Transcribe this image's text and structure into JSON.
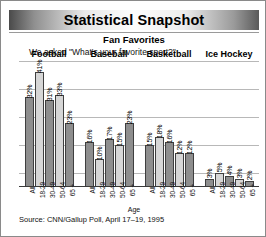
{
  "header": {
    "title": "Statistical Snapshot",
    "subtitle": "Fan Favorites",
    "question": "We asked \"What's your favorite sport?\""
  },
  "footer": {
    "source": "Source: CNN/Gallup Poll, April 17–19, 1995"
  },
  "chart_data": {
    "type": "bar",
    "title": "Fan Favorites",
    "subtitle": "We asked \"What's your favorite sport?\"",
    "xlabel": "Age",
    "ylabel": "",
    "ylim": [
      0,
      45
    ],
    "grid": true,
    "legend": "none",
    "categories": [
      "All",
      "18-29",
      "30-49",
      "50-64",
      "65 +"
    ],
    "groups": [
      {
        "name": "Football",
        "values": [
          32,
          41,
          31,
          33,
          23
        ],
        "labels": [
          "32%",
          "41%",
          "31%",
          "33%",
          "23%"
        ]
      },
      {
        "name": "Baseball",
        "values": [
          16,
          10,
          17,
          15,
          23
        ],
        "labels": [
          "16%",
          "10%",
          "17%",
          "15%",
          "23%"
        ]
      },
      {
        "name": "Basketball",
        "values": [
          15,
          18,
          16,
          12,
          12
        ],
        "labels": [
          "15%",
          "18%",
          "16%",
          "12%",
          "12%"
        ]
      },
      {
        "name": "Ice Hockey",
        "values": [
          3,
          5,
          4,
          3,
          2
        ],
        "labels": [
          "3%",
          "5%",
          "4%",
          "3%",
          "2%"
        ]
      }
    ],
    "colors": {
      "bar_dark": "#8e8e8e",
      "bar_light": "#d6d6d6",
      "bar_outline": "#3f3f3f",
      "gridline": "#b8b8b8",
      "baseline": "#3a3a3a"
    }
  }
}
